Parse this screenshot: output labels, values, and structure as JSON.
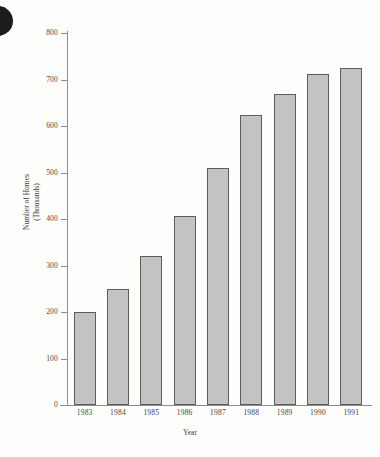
{
  "chart_data": {
    "type": "bar",
    "title": "",
    "xlabel": "Year",
    "ylabel": "Number of Homes",
    "ylabel_line2": "(Thousands)",
    "categories": [
      "1983",
      "1984",
      "1985",
      "1986",
      "1987",
      "1988",
      "1989",
      "1990",
      "1991"
    ],
    "values": [
      200,
      250,
      320,
      407,
      510,
      623,
      668,
      712,
      725
    ],
    "ylim": [
      0,
      800
    ],
    "ytick_labels": [
      "800",
      "700",
      "600",
      "500",
      "400",
      "300",
      "200",
      "100",
      "0"
    ],
    "ytick_values": [
      800,
      700,
      600,
      500,
      400,
      300,
      200,
      100,
      0
    ],
    "grid": false,
    "legend": "none",
    "bar_color": "#c3c3c3",
    "bar_border_color": "#5c5c5c",
    "axis_color": "#8d8d8d",
    "background_color": "#fdfdfc"
  }
}
